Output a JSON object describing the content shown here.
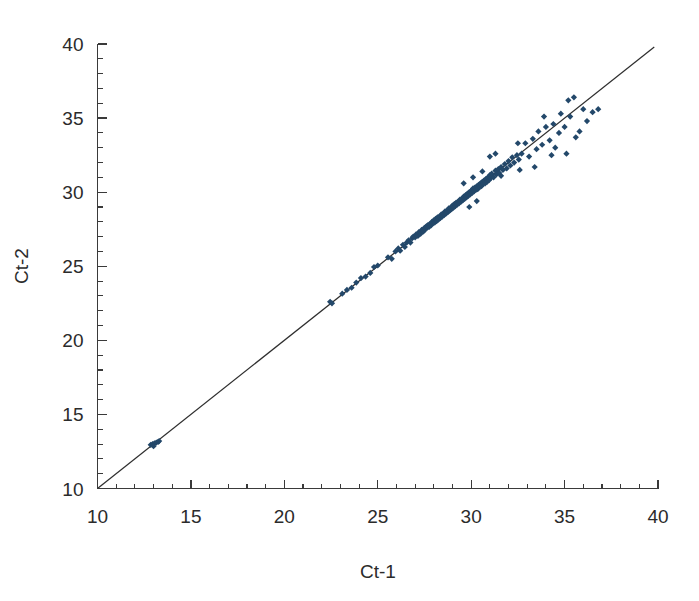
{
  "chart_data": {
    "type": "scatter",
    "title": "",
    "subtitle": "",
    "xlabel": "Ct-1",
    "ylabel": "Ct-2",
    "xlim": [
      10,
      40
    ],
    "ylim": [
      10,
      40
    ],
    "xticks": [
      10,
      15,
      20,
      25,
      30,
      35,
      40
    ],
    "xtick_labels": [
      "10",
      "15",
      "20",
      "25",
      "30",
      "35",
      "40"
    ],
    "yticks": [
      10,
      15,
      20,
      25,
      30,
      35,
      40
    ],
    "ytick_labels": [
      "10",
      "15",
      "20",
      "25",
      "30",
      "35",
      "40"
    ],
    "minor_tick_interval": 1,
    "grid": false,
    "legend": null,
    "marker_color": "#23486a",
    "marker_shape": "diamond",
    "marker_size_px": 5,
    "reference_line": {
      "name": "identity-line",
      "type": "line",
      "equation": "y = x",
      "slope": 1,
      "intercept": 0,
      "color": "#2e2e2e",
      "x_start": 10,
      "y_start": 10,
      "x_end": 39.8,
      "y_end": 39.8
    },
    "annotations": [],
    "series": [
      {
        "name": "Ct replicate pairs",
        "color": "#23486a",
        "points": [
          [
            12.85,
            12.95
          ],
          [
            12.95,
            13.0
          ],
          [
            13.05,
            13.05
          ],
          [
            13.15,
            13.1
          ],
          [
            13.25,
            13.15
          ],
          [
            13.0,
            12.85
          ],
          [
            13.3,
            13.2
          ],
          [
            22.45,
            22.6
          ],
          [
            22.55,
            22.5
          ],
          [
            23.1,
            23.15
          ],
          [
            23.35,
            23.4
          ],
          [
            23.6,
            23.55
          ],
          [
            23.85,
            23.9
          ],
          [
            24.1,
            24.2
          ],
          [
            24.35,
            24.3
          ],
          [
            24.6,
            24.55
          ],
          [
            24.8,
            24.95
          ],
          [
            25.0,
            25.05
          ],
          [
            25.55,
            25.6
          ],
          [
            25.75,
            25.5
          ],
          [
            25.95,
            26.0
          ],
          [
            26.1,
            26.2
          ],
          [
            26.2,
            26.05
          ],
          [
            26.35,
            26.45
          ],
          [
            26.45,
            26.3
          ],
          [
            26.55,
            26.6
          ],
          [
            26.65,
            26.75
          ],
          [
            26.75,
            26.6
          ],
          [
            26.85,
            26.9
          ],
          [
            26.9,
            27.0
          ],
          [
            27.0,
            26.95
          ],
          [
            27.05,
            27.15
          ],
          [
            27.15,
            27.05
          ],
          [
            27.2,
            27.3
          ],
          [
            27.3,
            27.2
          ],
          [
            27.35,
            27.45
          ],
          [
            27.45,
            27.35
          ],
          [
            27.5,
            27.6
          ],
          [
            27.55,
            27.5
          ],
          [
            27.6,
            27.7
          ],
          [
            27.65,
            27.6
          ],
          [
            27.7,
            27.8
          ],
          [
            27.75,
            27.65
          ],
          [
            27.8,
            27.85
          ],
          [
            27.85,
            27.75
          ],
          [
            27.9,
            28.0
          ],
          [
            27.95,
            27.9
          ],
          [
            28.0,
            28.1
          ],
          [
            28.05,
            27.95
          ],
          [
            28.1,
            28.2
          ],
          [
            28.15,
            28.05
          ],
          [
            28.2,
            28.3
          ],
          [
            28.25,
            28.15
          ],
          [
            28.3,
            28.35
          ],
          [
            28.35,
            28.25
          ],
          [
            28.4,
            28.5
          ],
          [
            28.45,
            28.35
          ],
          [
            28.5,
            28.55
          ],
          [
            28.55,
            28.45
          ],
          [
            28.6,
            28.7
          ],
          [
            28.65,
            28.55
          ],
          [
            28.7,
            28.75
          ],
          [
            28.75,
            28.65
          ],
          [
            28.8,
            28.9
          ],
          [
            28.85,
            28.75
          ],
          [
            28.9,
            28.95
          ],
          [
            28.95,
            28.85
          ],
          [
            29.0,
            29.1
          ],
          [
            29.05,
            28.95
          ],
          [
            29.1,
            29.2
          ],
          [
            29.15,
            29.05
          ],
          [
            29.2,
            29.3
          ],
          [
            29.25,
            29.15
          ],
          [
            29.3,
            29.35
          ],
          [
            29.35,
            29.25
          ],
          [
            29.4,
            29.5
          ],
          [
            29.45,
            29.35
          ],
          [
            29.5,
            29.55
          ],
          [
            29.55,
            29.45
          ],
          [
            29.6,
            29.7
          ],
          [
            29.65,
            29.55
          ],
          [
            29.7,
            29.8
          ],
          [
            29.75,
            29.65
          ],
          [
            29.8,
            29.9
          ],
          [
            29.85,
            29.75
          ],
          [
            29.9,
            30.0
          ],
          [
            29.95,
            29.85
          ],
          [
            30.0,
            30.1
          ],
          [
            30.05,
            29.95
          ],
          [
            30.1,
            30.25
          ],
          [
            30.15,
            30.05
          ],
          [
            30.2,
            30.3
          ],
          [
            30.25,
            30.15
          ],
          [
            30.3,
            30.4
          ],
          [
            30.35,
            30.2
          ],
          [
            30.4,
            30.5
          ],
          [
            30.45,
            30.35
          ],
          [
            30.5,
            30.6
          ],
          [
            30.55,
            30.4
          ],
          [
            30.6,
            30.7
          ],
          [
            30.65,
            30.55
          ],
          [
            30.7,
            30.8
          ],
          [
            30.75,
            30.6
          ],
          [
            30.8,
            30.9
          ],
          [
            30.85,
            30.7
          ],
          [
            30.9,
            31.0
          ],
          [
            30.95,
            30.8
          ],
          [
            31.0,
            31.15
          ],
          [
            31.05,
            30.95
          ],
          [
            31.1,
            31.25
          ],
          [
            31.2,
            31.0
          ],
          [
            31.3,
            31.45
          ],
          [
            31.35,
            31.2
          ],
          [
            31.45,
            31.55
          ],
          [
            31.5,
            31.3
          ],
          [
            31.6,
            31.7
          ],
          [
            31.7,
            31.5
          ],
          [
            31.8,
            31.9
          ],
          [
            31.9,
            31.6
          ],
          [
            32.0,
            32.1
          ],
          [
            32.1,
            31.8
          ],
          [
            32.2,
            32.35
          ],
          [
            32.3,
            32.0
          ],
          [
            32.45,
            32.5
          ],
          [
            32.55,
            32.2
          ],
          [
            32.7,
            32.6
          ],
          [
            29.6,
            30.6
          ],
          [
            30.1,
            31.0
          ],
          [
            30.6,
            31.4
          ],
          [
            31.0,
            32.4
          ],
          [
            31.3,
            32.6
          ],
          [
            31.6,
            31.1
          ],
          [
            30.3,
            29.4
          ],
          [
            29.9,
            29.0
          ],
          [
            32.5,
            33.3
          ],
          [
            32.9,
            33.3
          ],
          [
            33.1,
            32.4
          ],
          [
            33.3,
            33.6
          ],
          [
            33.5,
            32.9
          ],
          [
            33.6,
            34.1
          ],
          [
            33.8,
            33.2
          ],
          [
            34.0,
            34.4
          ],
          [
            34.2,
            33.5
          ],
          [
            34.4,
            34.6
          ],
          [
            34.5,
            33.0
          ],
          [
            34.7,
            34.0
          ],
          [
            34.8,
            35.3
          ],
          [
            35.0,
            34.4
          ],
          [
            35.2,
            36.2
          ],
          [
            35.3,
            35.1
          ],
          [
            35.5,
            36.4
          ],
          [
            35.6,
            33.7
          ],
          [
            35.8,
            34.1
          ],
          [
            36.0,
            35.6
          ],
          [
            36.2,
            34.8
          ],
          [
            36.5,
            35.4
          ],
          [
            36.8,
            35.6
          ],
          [
            33.9,
            35.1
          ],
          [
            34.3,
            32.5
          ],
          [
            35.1,
            32.6
          ],
          [
            33.4,
            31.7
          ],
          [
            32.6,
            31.5
          ]
        ]
      }
    ]
  },
  "axis": {
    "x_title": "Ct-1",
    "y_title": "Ct-2"
  }
}
